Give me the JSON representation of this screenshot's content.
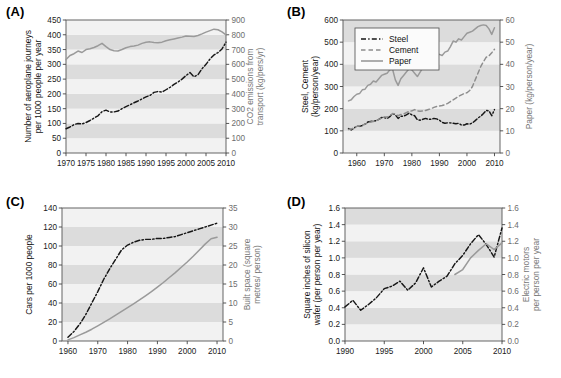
{
  "figure": {
    "panels": [
      {
        "key": "A",
        "label": "(A)",
        "x_axis": {
          "label": "",
          "min": 1970,
          "max": 2010,
          "ticks": [
            1970,
            1975,
            1980,
            1985,
            1990,
            1995,
            2000,
            2005,
            2010
          ]
        },
        "y_left": {
          "label": "Number of aeroplane journeys per 1000 people per year",
          "min": 0,
          "max": 450,
          "ticks": [
            0,
            50,
            100,
            150,
            200,
            250,
            300,
            350,
            400,
            450
          ]
        },
        "y_right": {
          "label": "CO2 emissions from transport (kg/pers/yr)",
          "min": 0,
          "max": 900,
          "ticks": [
            0,
            100,
            200,
            300,
            400,
            500,
            600,
            700,
            800,
            900
          ]
        },
        "series": [
          {
            "name": "Aeroplane journeys",
            "axis": "left",
            "style": "dashdot",
            "color": "#161616",
            "x": [
              1970,
              1971,
              1972,
              1973,
              1974,
              1975,
              1976,
              1977,
              1978,
              1979,
              1980,
              1981,
              1982,
              1983,
              1984,
              1985,
              1986,
              1987,
              1988,
              1989,
              1990,
              1991,
              1992,
              1993,
              1994,
              1995,
              1996,
              1997,
              1998,
              1999,
              2000,
              2001,
              2002,
              2003,
              2004,
              2005,
              2006,
              2007,
              2008,
              2009,
              2010
            ],
            "y": [
              82,
              88,
              96,
              100,
              98,
              103,
              110,
              118,
              126,
              140,
              145,
              139,
              139,
              142,
              150,
              157,
              163,
              170,
              176,
              183,
              190,
              195,
              205,
              208,
              206,
              214,
              222,
              232,
              240,
              250,
              262,
              272,
              258,
              265,
              285,
              300,
              318,
              332,
              340,
              352,
              375
            ]
          },
          {
            "name": "CO2 emissions from transport",
            "axis": "right",
            "style": "solid",
            "color": "#9a9a9a",
            "x": [
              1970,
              1971,
              1972,
              1973,
              1974,
              1975,
              1976,
              1977,
              1978,
              1979,
              1980,
              1981,
              1982,
              1983,
              1984,
              1985,
              1986,
              1987,
              1988,
              1989,
              1990,
              1991,
              1992,
              1993,
              1994,
              1995,
              1996,
              1997,
              1998,
              1999,
              2000,
              2001,
              2002,
              2003,
              2004,
              2005,
              2006,
              2007,
              2008,
              2009,
              2010
            ],
            "y": [
              632,
              660,
              672,
              690,
              680,
              700,
              706,
              714,
              726,
              742,
              720,
              700,
              692,
              690,
              700,
              712,
              720,
              724,
              730,
              742,
              750,
              752,
              748,
              746,
              750,
              760,
              766,
              772,
              778,
              784,
              792,
              790,
              788,
              795,
              806,
              818,
              828,
              838,
              834,
              820,
              800
            ]
          }
        ]
      },
      {
        "key": "B",
        "label": "(B)",
        "x_axis": {
          "label": "",
          "min": 1955,
          "max": 2012,
          "ticks": [
            1960,
            1970,
            1980,
            1990,
            2000,
            2010
          ]
        },
        "y_left": {
          "label": "Steel, Cement (kg/person/year)",
          "min": 0,
          "max": 600,
          "ticks": [
            0,
            100,
            200,
            300,
            400,
            500,
            600
          ]
        },
        "y_right": {
          "label": "Paper (kg/person/year)",
          "min": 0,
          "max": 60,
          "ticks": [
            0,
            10,
            20,
            30,
            40,
            50,
            60
          ]
        },
        "legend": [
          {
            "label": "Steel",
            "style": "dashdot",
            "color": "#161616"
          },
          {
            "label": "Cement",
            "style": "dashed",
            "color": "#8d8d8d"
          },
          {
            "label": "Paper",
            "style": "solid",
            "color": "#9a9a9a"
          }
        ],
        "series": [
          {
            "name": "Steel",
            "axis": "left",
            "style": "dashdot",
            "color": "#161616",
            "x": [
              1957,
              1958,
              1959,
              1960,
              1961,
              1962,
              1963,
              1964,
              1965,
              1966,
              1967,
              1968,
              1969,
              1970,
              1971,
              1972,
              1973,
              1974,
              1975,
              1976,
              1977,
              1978,
              1979,
              1980,
              1981,
              1982,
              1983,
              1984,
              1985,
              1986,
              1987,
              1988,
              1989,
              1990,
              1991,
              1992,
              1993,
              1994,
              1995,
              1996,
              1997,
              1998,
              1999,
              2000,
              2001,
              2002,
              2003,
              2004,
              2005,
              2006,
              2007,
              2008,
              2009,
              2010
            ],
            "y": [
              110,
              104,
              112,
              122,
              120,
              124,
              130,
              140,
              142,
              144,
              146,
              152,
              160,
              160,
              156,
              164,
              178,
              172,
              156,
              166,
              166,
              172,
              180,
              172,
              168,
              150,
              148,
              152,
              156,
              152,
              152,
              156,
              154,
              148,
              138,
              134,
              136,
              136,
              134,
              132,
              134,
              126,
              126,
              132,
              130,
              136,
              146,
              158,
              166,
              178,
              192,
              190,
              168,
              196
            ]
          },
          {
            "name": "Cement",
            "axis": "left",
            "style": "dashed",
            "color": "#8d8d8d",
            "x": [
              1957,
              1958,
              1959,
              1960,
              1961,
              1962,
              1963,
              1964,
              1965,
              1966,
              1967,
              1968,
              1969,
              1970,
              1971,
              1972,
              1973,
              1974,
              1975,
              1976,
              1977,
              1978,
              1979,
              1980,
              1981,
              1982,
              1983,
              1984,
              1985,
              1986,
              1987,
              1988,
              1989,
              1990,
              1991,
              1992,
              1993,
              1994,
              1995,
              1996,
              1997,
              1998,
              1999,
              2000,
              2001,
              2002,
              2003,
              2004,
              2005,
              2006,
              2007,
              2008,
              2009,
              2010
            ],
            "y": [
              106,
              108,
              114,
              120,
              122,
              126,
              130,
              136,
              140,
              142,
              146,
              152,
              158,
              162,
              162,
              168,
              178,
              176,
              168,
              174,
              176,
              182,
              188,
              190,
              196,
              190,
              188,
              190,
              192,
              196,
              200,
              206,
              210,
              212,
              214,
              218,
              224,
              232,
              240,
              248,
              256,
              262,
              268,
              272,
              282,
              300,
              330,
              360,
              390,
              412,
              432,
              438,
              452,
              468
            ]
          },
          {
            "name": "Paper",
            "axis": "right",
            "style": "solid",
            "color": "#9a9a9a",
            "x": [
              1957,
              1958,
              1959,
              1960,
              1961,
              1962,
              1963,
              1964,
              1965,
              1966,
              1967,
              1968,
              1969,
              1970,
              1971,
              1972,
              1973,
              1974,
              1975,
              1976,
              1977,
              1978,
              1979,
              1980,
              1981,
              1982,
              1983,
              1984,
              1985,
              1986,
              1987,
              1988,
              1989,
              1990,
              1991,
              1992,
              1993,
              1994,
              1995,
              1996,
              1997,
              1998,
              1999,
              2000,
              2001,
              2002,
              2003,
              2004,
              2005,
              2006,
              2007,
              2008,
              2009,
              2010
            ],
            "y": [
              23.5,
              24.0,
              25.5,
              26.5,
              26.8,
              28.5,
              28.8,
              30.5,
              31.0,
              32.5,
              32.0,
              33.5,
              35.0,
              35.5,
              36.0,
              37.5,
              37.8,
              33.0,
              30.5,
              33.5,
              35.0,
              36.5,
              38.0,
              37.5,
              36.0,
              34.5,
              36.5,
              38.5,
              39.0,
              40.0,
              41.5,
              43.5,
              44.0,
              44.5,
              44.0,
              45.5,
              46.0,
              48.0,
              50.5,
              50.0,
              51.5,
              51.0,
              52.5,
              54.0,
              54.5,
              55.0,
              56.0,
              57.0,
              57.5,
              57.8,
              57.5,
              56.0,
              53.5,
              56.5
            ]
          }
        ]
      },
      {
        "key": "C",
        "label": "(C)",
        "x_axis": {
          "label": "",
          "min": 1958,
          "max": 2012,
          "ticks": [
            1960,
            1970,
            1980,
            1990,
            2000,
            2010
          ]
        },
        "y_left": {
          "label": "Cars per 1000 people",
          "min": 0,
          "max": 140,
          "ticks": [
            0,
            20,
            40,
            60,
            80,
            100,
            120,
            140
          ]
        },
        "y_right": {
          "label": "Built space (square metres/ person)",
          "min": 0,
          "max": 35,
          "ticks": [
            0,
            5,
            10,
            15,
            20,
            25,
            30,
            35
          ]
        },
        "series": [
          {
            "name": "Cars per 1000 people",
            "axis": "left",
            "style": "dashdot",
            "color": "#161616",
            "x": [
              1960,
              1962,
              1964,
              1966,
              1968,
              1970,
              1972,
              1974,
              1976,
              1978,
              1980,
              1982,
              1984,
              1986,
              1988,
              1990,
              1992,
              1994,
              1996,
              1998,
              2000,
              2002,
              2004,
              2006,
              2008,
              2010
            ],
            "y": [
              4,
              10,
              18,
              28,
              40,
              52,
              65,
              76,
              86,
              96,
              101,
              104,
              106,
              107,
              107,
              108,
              108,
              109,
              110,
              112,
              114,
              116,
              118,
              120,
              122,
              124
            ]
          },
          {
            "name": "Built space",
            "axis": "right",
            "style": "solid",
            "color": "#9a9a9a",
            "x": [
              1960,
              1962,
              1964,
              1966,
              1968,
              1970,
              1972,
              1974,
              1976,
              1978,
              1980,
              1982,
              1984,
              1986,
              1988,
              1990,
              1992,
              1994,
              1996,
              1998,
              2000,
              2002,
              2004,
              2006,
              2008,
              2010
            ],
            "y": [
              0.3,
              0.9,
              1.6,
              2.3,
              3.1,
              4.0,
              4.9,
              5.8,
              6.8,
              7.8,
              8.8,
              9.8,
              10.8,
              11.9,
              13.0,
              14.2,
              15.4,
              16.7,
              18.0,
              19.4,
              20.8,
              22.3,
              23.9,
              25.5,
              26.9,
              27.3
            ]
          }
        ]
      },
      {
        "key": "D",
        "label": "(D)",
        "x_axis": {
          "label": "",
          "min": 1990,
          "max": 2010,
          "ticks": [
            1990,
            1995,
            2000,
            2005,
            2010
          ]
        },
        "y_left": {
          "label": "Square inches of silicon wafer (per person per year)",
          "min": 0.0,
          "max": 1.6,
          "ticks": [
            0.0,
            0.2,
            0.4,
            0.6,
            0.8,
            1.0,
            1.2,
            1.4,
            1.6
          ]
        },
        "y_right": {
          "label": "Electric motors per person per year",
          "min": 0.0,
          "max": 1.6,
          "ticks": [
            0.0,
            0.2,
            0.4,
            0.6,
            0.8,
            1.0,
            1.2,
            1.4,
            1.6
          ]
        },
        "series": [
          {
            "name": "Silicon wafer",
            "axis": "left",
            "style": "dashdot",
            "color": "#161616",
            "x": [
              1990,
              1991,
              1992,
              1993,
              1994,
              1995,
              1996,
              1997,
              1998,
              1999,
              2000,
              2001,
              2002,
              2003,
              2004,
              2005,
              2006,
              2007,
              2008,
              2009,
              2010
            ],
            "y": [
              0.41,
              0.49,
              0.37,
              0.44,
              0.52,
              0.63,
              0.66,
              0.72,
              0.61,
              0.7,
              0.88,
              0.65,
              0.72,
              0.78,
              0.93,
              1.03,
              1.17,
              1.28,
              1.16,
              1.01,
              1.36
            ]
          },
          {
            "name": "Electric motors",
            "axis": "right",
            "style": "solid",
            "color": "#9a9a9a",
            "x": [
              2004,
              2005,
              2006,
              2007,
              2008,
              2009,
              2010
            ],
            "y": [
              0.8,
              0.86,
              1.0,
              1.09,
              1.17,
              1.1,
              1.18
            ]
          }
        ]
      }
    ],
    "tick_label_format": {
      "A": "int",
      "B": "int",
      "C": "int",
      "D": "one-dec"
    },
    "style": {
      "band_light": "#f2f2f2",
      "band_dark": "#dcdcdc",
      "plot_border": "#555555",
      "axis_color": "#444444"
    }
  }
}
